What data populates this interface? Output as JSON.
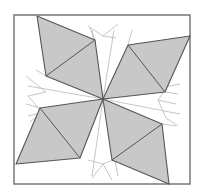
{
  "diagram": {
    "title": "",
    "colors": {
      "fill": "#c8c8c8",
      "stroke": "#555555",
      "frame": "#777777",
      "construction": "#b8b8b8"
    },
    "frame": {
      "x": 14,
      "y": 15,
      "w": 176,
      "h": 169
    },
    "center": [
      103,
      99
    ],
    "shapes": [
      {
        "name": "top-left",
        "points": [
          [
            37,
            16
          ],
          [
            95,
            40
          ],
          [
            103,
            99
          ],
          [
            46,
            76
          ]
        ],
        "diagonal": [
          [
            46,
            76
          ],
          [
            95,
            40
          ]
        ]
      },
      {
        "name": "top-right",
        "points": [
          [
            128,
            45
          ],
          [
            190,
            36
          ],
          [
            165,
            92
          ],
          [
            103,
            99
          ]
        ],
        "diagonal": [
          [
            128,
            45
          ],
          [
            165,
            92
          ]
        ]
      },
      {
        "name": "bottom-left",
        "points": [
          [
            40,
            108
          ],
          [
            103,
            99
          ],
          [
            80,
            158
          ],
          [
            16,
            164
          ]
        ],
        "diagonal": [
          [
            40,
            108
          ],
          [
            80,
            158
          ]
        ]
      },
      {
        "name": "bottom-right",
        "points": [
          [
            103,
            99
          ],
          [
            162,
            124
          ],
          [
            169,
            184
          ],
          [
            112,
            160
          ]
        ],
        "diagonal": [
          [
            112,
            160
          ],
          [
            162,
            124
          ]
        ]
      }
    ],
    "construction_lines": [
      [
        [
          103,
          99
        ],
        [
          28,
          86
        ]
      ],
      [
        [
          103,
          99
        ],
        [
          28,
          116
        ]
      ],
      [
        [
          103,
          99
        ],
        [
          180,
          84
        ]
      ],
      [
        [
          103,
          99
        ],
        [
          180,
          114
        ]
      ],
      [
        [
          103,
          99
        ],
        [
          92,
          30
        ]
      ],
      [
        [
          103,
          99
        ],
        [
          114,
          30
        ]
      ],
      [
        [
          103,
          99
        ],
        [
          92,
          176
        ]
      ],
      [
        [
          103,
          99
        ],
        [
          118,
          176
        ]
      ],
      [
        [
          26,
          76
        ],
        [
          46,
          92
        ]
      ],
      [
        [
          28,
          96
        ],
        [
          46,
          92
        ]
      ],
      [
        [
          28,
          96
        ],
        [
          42,
          112
        ]
      ],
      [
        [
          42,
          112
        ],
        [
          30,
          122
        ]
      ],
      [
        [
          88,
          26
        ],
        [
          103,
          36
        ]
      ],
      [
        [
          103,
          36
        ],
        [
          118,
          24
        ]
      ],
      [
        [
          103,
          36
        ],
        [
          116,
          38
        ]
      ],
      [
        [
          95,
          40
        ],
        [
          90,
          28
        ]
      ],
      [
        [
          128,
          45
        ],
        [
          132,
          30
        ]
      ],
      [
        [
          158,
          100
        ],
        [
          176,
          104
        ]
      ],
      [
        [
          158,
          100
        ],
        [
          168,
          86
        ]
      ],
      [
        [
          158,
          100
        ],
        [
          166,
          118
        ]
      ],
      [
        [
          166,
          118
        ],
        [
          178,
          126
        ]
      ],
      [
        [
          88,
          160
        ],
        [
          103,
          164
        ]
      ],
      [
        [
          103,
          164
        ],
        [
          118,
          158
        ]
      ],
      [
        [
          103,
          164
        ],
        [
          92,
          178
        ]
      ],
      [
        [
          103,
          164
        ],
        [
          112,
          180
        ]
      ],
      [
        [
          46,
          76
        ],
        [
          36,
          70
        ]
      ],
      [
        [
          40,
          108
        ],
        [
          26,
          104
        ]
      ],
      [
        [
          165,
          92
        ],
        [
          178,
          94
        ]
      ],
      [
        [
          162,
          124
        ],
        [
          176,
          126
        ]
      ]
    ]
  }
}
